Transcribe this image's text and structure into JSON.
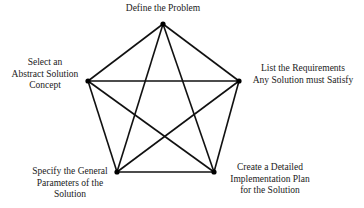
{
  "diagram": {
    "type": "complete-graph-pentagon",
    "nodes": [
      {
        "id": "define",
        "lines": [
          "Define the Problem"
        ],
        "x": 163,
        "y": 24
      },
      {
        "id": "requirements",
        "lines": [
          "List the Requirements",
          "Any Solution must Satisfy"
        ],
        "x": 239,
        "y": 81
      },
      {
        "id": "implementation",
        "lines": [
          "Create a Detailed",
          "Implementation Plan",
          "for the Solution"
        ],
        "x": 214,
        "y": 172
      },
      {
        "id": "parameters",
        "lines": [
          "Specify the General",
          "Parameters of the",
          "Solution"
        ],
        "x": 117,
        "y": 172
      },
      {
        "id": "concept",
        "lines": [
          "Select an",
          "Abstract Solution",
          "Concept"
        ],
        "x": 88,
        "y": 81
      }
    ],
    "edges": [
      [
        "define",
        "requirements"
      ],
      [
        "define",
        "implementation"
      ],
      [
        "define",
        "parameters"
      ],
      [
        "define",
        "concept"
      ],
      [
        "requirements",
        "implementation"
      ],
      [
        "requirements",
        "parameters"
      ],
      [
        "requirements",
        "concept"
      ],
      [
        "implementation",
        "parameters"
      ],
      [
        "implementation",
        "concept"
      ],
      [
        "parameters",
        "concept"
      ]
    ],
    "colors": {
      "edge": "#111111",
      "node": "#000000",
      "text": "#1a1a1a",
      "background": "#ffffff"
    }
  }
}
